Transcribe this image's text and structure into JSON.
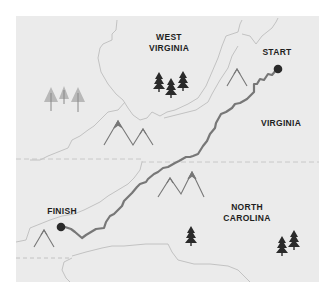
{
  "map": {
    "title": "Appalachian Trail route map",
    "background_color": "#ebebeb",
    "route_color": "#777777",
    "border_color": "#bdbdbd",
    "label_color": "#1e1e1e",
    "labels": {
      "west_virginia_line1": "WEST",
      "west_virginia_line2": "VIRGINIA",
      "virginia": "VIRGINIA",
      "north_carolina_line1": "NORTH",
      "north_carolina_line2": "CAROLINA",
      "start": "START",
      "finish": "FINISH"
    },
    "icons": [
      "pine-tree-icon",
      "light-tree-icon",
      "mountain-icon",
      "start-marker-icon",
      "finish-marker-icon"
    ]
  }
}
